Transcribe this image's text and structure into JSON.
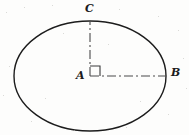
{
  "figure": {
    "kind": "geometry-diagram",
    "shape": "ellipse",
    "background_color": "#fdfdfc",
    "stroke_color": "#1c1c1c",
    "center_line_color": "#4a4a4a",
    "labels": {
      "center": "A",
      "top": "C",
      "right": "B"
    },
    "geometry": {
      "center_x": 90,
      "center_y": 76,
      "semi_major_axis_x": 76,
      "semi_minor_axis_y": 55,
      "outline_stroke_width": 1.4,
      "center_line_stroke_width": 1.1,
      "center_line_dash_pattern": "9 3 2 3",
      "right_angle_marker_size": 10
    },
    "segments": [
      {
        "name": "semi-minor-axis-AC",
        "from": "A",
        "to": "C",
        "style": "dash-dot",
        "orientation": "vertical"
      },
      {
        "name": "semi-major-axis-AB",
        "from": "A",
        "to": "B",
        "style": "dash-dot",
        "orientation": "horizontal"
      }
    ],
    "markers": [
      {
        "name": "right-angle-at-A",
        "at": "A",
        "between": [
          "AC",
          "AB"
        ]
      }
    ]
  }
}
